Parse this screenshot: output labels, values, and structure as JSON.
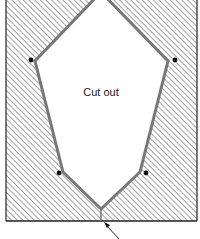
{
  "diagram": {
    "label": "Cut out",
    "colors": {
      "hatch": "#8a8a8a",
      "outline": "#777777",
      "frame": "#222222",
      "dot": "#111111",
      "background": "#ffffff"
    },
    "vertices": [
      {
        "name": "top-apex",
        "x": 101,
        "y": -8
      },
      {
        "name": "upper-right",
        "x": 168,
        "y": 61
      },
      {
        "name": "lower-right",
        "x": 140,
        "y": 172
      },
      {
        "name": "bottom-apex",
        "x": 101,
        "y": 209
      },
      {
        "name": "lower-left",
        "x": 63,
        "y": 172
      },
      {
        "name": "upper-left",
        "x": 35,
        "y": 61
      }
    ],
    "dots": [
      {
        "x": 31,
        "y": 60
      },
      {
        "x": 175,
        "y": 60
      },
      {
        "x": 59,
        "y": 173
      },
      {
        "x": 146,
        "y": 173
      }
    ]
  }
}
